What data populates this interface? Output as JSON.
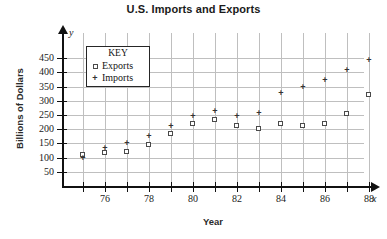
{
  "chart_data": {
    "type": "scatter",
    "title": "U.S. Imports and Exports",
    "xlabel": "Year",
    "ylabel": "Billions of Dollars",
    "x_axis_symbol": "x",
    "y_axis_symbol": "y",
    "xlim": [
      74,
      89
    ],
    "ylim": [
      0,
      470
    ],
    "grid": true,
    "legend_position": "inside-upper-left",
    "legend_title": "KEY",
    "x_tick_labels": [
      "76",
      "78",
      "80",
      "82",
      "84",
      "86",
      "88"
    ],
    "x_tick_values": [
      76,
      78,
      80,
      82,
      84,
      86,
      88
    ],
    "x_minor_ticks": [
      75,
      77,
      79,
      81,
      83,
      85,
      87
    ],
    "y_tick_labels": [
      "50",
      "100",
      "150",
      "200",
      "250",
      "300",
      "350",
      "400",
      "450"
    ],
    "y_tick_values": [
      50,
      100,
      150,
      200,
      250,
      300,
      350,
      400,
      450
    ],
    "x": [
      75,
      76,
      77,
      78,
      79,
      80,
      81,
      82,
      83,
      84,
      85,
      86,
      87,
      88
    ],
    "series": [
      {
        "name": "Exports",
        "marker": "open-square",
        "color": "#4a4a4a",
        "values": [
          108,
          115,
          121,
          144,
          182,
          220,
          233,
          212,
          201,
          217,
          213,
          217,
          253,
          322
        ]
      },
      {
        "name": "Imports",
        "marker": "plus",
        "color": "#333333",
        "values": [
          98,
          133,
          151,
          176,
          210,
          245,
          261,
          245,
          257,
          326,
          346,
          370,
          405,
          442
        ]
      }
    ]
  },
  "legend": {
    "title": "KEY",
    "entries": [
      {
        "label": "Exports",
        "symbol": "open-square"
      },
      {
        "label": "Imports",
        "symbol": "plus"
      }
    ]
  },
  "colors": {
    "axis": "#111111",
    "grid": "#bfbfbf",
    "exports": "#4a4a4a",
    "imports": "#333333",
    "background": "#ffffff"
  }
}
